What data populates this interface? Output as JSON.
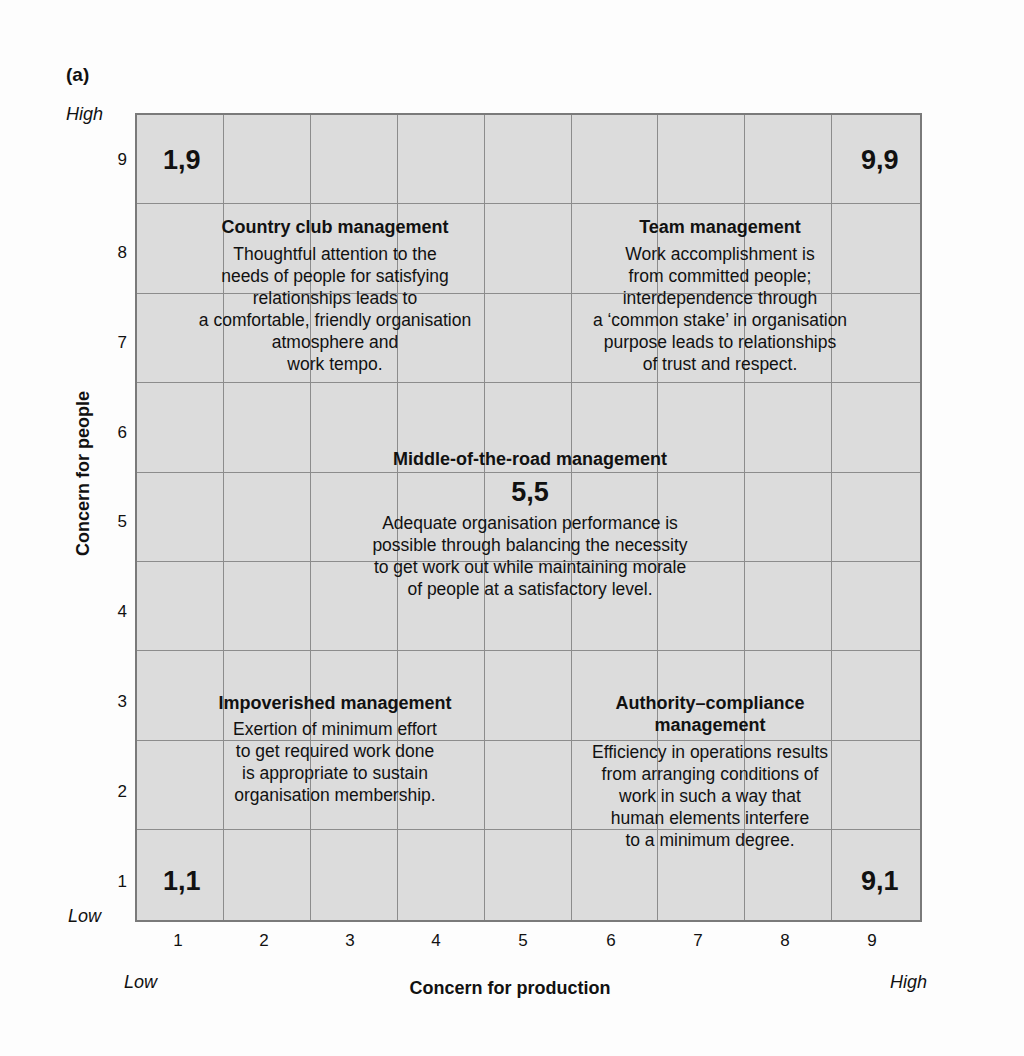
{
  "panel_label": "(a)",
  "axes": {
    "y_title": "Concern for people",
    "x_title": "Concern for production",
    "y_high": "High",
    "y_low": "Low",
    "x_low": "Low",
    "x_high": "High",
    "y_ticks": [
      "9",
      "8",
      "7",
      "6",
      "5",
      "4",
      "3",
      "2",
      "1"
    ],
    "x_ticks": [
      "1",
      "2",
      "3",
      "4",
      "5",
      "6",
      "7",
      "8",
      "9"
    ]
  },
  "corners": {
    "c19": "1,9",
    "c99": "9,9",
    "c55": "5,5",
    "c11": "1,1",
    "c91": "9,1"
  },
  "styles": {
    "country_club": {
      "title": "Country club management",
      "lines": [
        "Thoughtful attention to the",
        "needs of people for satisfying",
        "relationships leads to",
        "a comfortable, friendly organisation",
        "atmosphere and",
        "work tempo."
      ]
    },
    "team": {
      "title": "Team management",
      "lines": [
        "Work accomplishment is",
        "from committed people;",
        "interdependence through",
        "a ‘common stake’ in organisation",
        "purpose leads to relationships",
        "of trust and respect."
      ]
    },
    "middle": {
      "title": "Middle-of-the-road management",
      "lines": [
        "Adequate organisation performance is",
        "possible through balancing the necessity",
        "to get work out while maintaining morale",
        "of people at a satisfactory level."
      ]
    },
    "impoverished": {
      "title": "Impoverished management",
      "lines": [
        "Exertion of minimum effort",
        "to get required work done",
        "is appropriate to sustain",
        "organisation membership."
      ]
    },
    "authority": {
      "title_lines": [
        "Authority–compliance",
        "management"
      ],
      "lines": [
        "Efficiency in operations results",
        "from arranging conditions of",
        "work in such a way that",
        "human elements interfere",
        "to a minimum degree."
      ]
    }
  },
  "colors": {
    "grid_fill": "#dcdcdc",
    "grid_line": "#8c8c8c",
    "border": "#7a7a7a",
    "text": "#111111"
  }
}
